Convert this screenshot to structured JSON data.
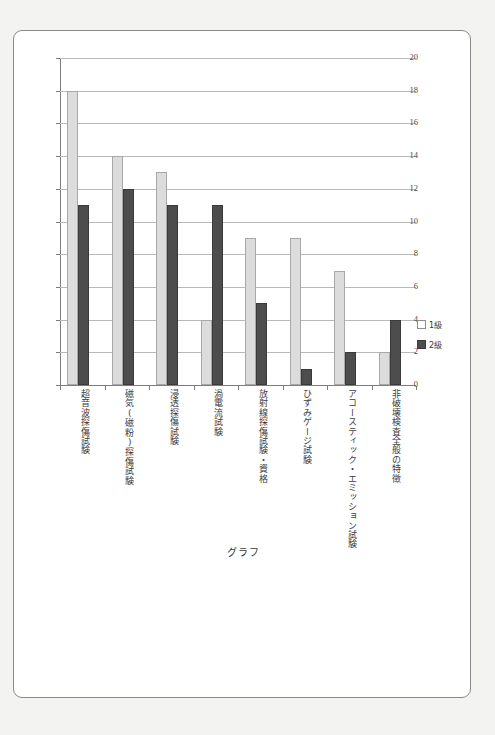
{
  "caption": "グラフ",
  "legend": {
    "position": "right",
    "entries": [
      {
        "label": "1級",
        "swatch": "light-swatch"
      },
      {
        "label": "2級",
        "swatch": "dark-swatch"
      }
    ]
  },
  "colors": {
    "series1": "#dcdcdc",
    "series2": "#4d4d4d",
    "gridline": "#b9b9b9",
    "axis": "#7d7d7d",
    "page_border": "#8a8a8a",
    "page_background": "#f3f3f1",
    "chart_background": "#ffffff"
  },
  "chart_data": {
    "type": "bar",
    "title": "グラフ",
    "xlabel": "",
    "ylabel": "",
    "ylim": [
      0,
      20
    ],
    "yticks": [
      0,
      2,
      4,
      6,
      8,
      10,
      12,
      14,
      16,
      18,
      20
    ],
    "grid": true,
    "legend_position": "right",
    "categories": [
      "超音波探傷試験",
      "磁気(磁粉)探傷試験",
      "浸透探傷試験",
      "渦電流試験",
      "放射線探傷試験・資格",
      "ひずみゲージ試験",
      "アコースティック・エミッション試験",
      "非破壊検査全般の特徴"
    ],
    "series": [
      {
        "name": "1級",
        "values": [
          18,
          14,
          13,
          4,
          9,
          9,
          7,
          2
        ]
      },
      {
        "name": "2級",
        "values": [
          11,
          12,
          11,
          11,
          5,
          1,
          2,
          4
        ]
      }
    ]
  }
}
